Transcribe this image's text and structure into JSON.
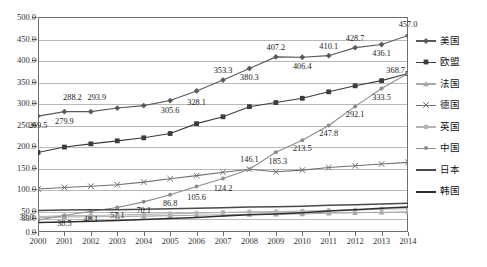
{
  "chart_data": {
    "type": "line",
    "title": "",
    "xlabel": "",
    "ylabel": "",
    "grid": true,
    "legend_position": "right",
    "x": [
      2000,
      2001,
      2002,
      2003,
      2004,
      2005,
      2006,
      2007,
      2008,
      2009,
      2010,
      2011,
      2012,
      2013,
      2014
    ],
    "categories": [
      "2000",
      "2001",
      "2002",
      "2003",
      "2004",
      "2005",
      "2006",
      "2007",
      "2008",
      "2009",
      "2010",
      "2011",
      "2012",
      "2013",
      "2014"
    ],
    "ylim": [
      0,
      500
    ],
    "yticks": [
      "0.0",
      "33.0",
      "50.0",
      "100.0",
      "150.0",
      "200.0",
      "250.0",
      "300.0",
      "350.0",
      "400.0",
      "450.0",
      "500.0"
    ],
    "ytick_values": [
      0,
      33,
      50,
      100,
      150,
      200,
      250,
      300,
      350,
      400,
      450,
      500
    ],
    "series": [
      {
        "name": "美国",
        "marker": "diamond",
        "color": "#5a5a5a",
        "values": [
          269.5,
          279.9,
          279.9,
          288.2,
          293.9,
          305.6,
          328.1,
          353.3,
          380.3,
          407.2,
          406.4,
          410.1,
          428.7,
          436.1,
          457.0
        ],
        "labels": [
          {
            "x": 2000,
            "value": "269.5"
          },
          {
            "x": 2001,
            "value": "279.9"
          },
          {
            "x": 2003,
            "value": "288.2"
          },
          {
            "x": 2005,
            "value": "293.9"
          },
          {
            "x": 2005,
            "value": "305.6"
          },
          {
            "x": 2006,
            "value": "328.1"
          },
          {
            "x": 2007,
            "value": "353.3"
          },
          {
            "x": 2008,
            "value": "380.3"
          },
          {
            "x": 2009,
            "value": "407.2"
          },
          {
            "x": 2010,
            "value": "406.4"
          },
          {
            "x": 2011,
            "value": "410.1"
          },
          {
            "x": 2012,
            "value": "428.7"
          },
          {
            "x": 2013,
            "value": "436.1"
          },
          {
            "x": 2014,
            "value": "457.0"
          }
        ]
      },
      {
        "name": "欧盟",
        "marker": "square",
        "color": "#3c3c3c",
        "values": [
          185.0,
          197.5,
          205.0,
          212.0,
          219.0,
          229.0,
          252.0,
          268.0,
          291.5,
          301.0,
          311.0,
          326.0,
          340.0,
          352.0,
          368.7
        ],
        "labels": []
      },
      {
        "name": "法国",
        "marker": "triangle",
        "color": "#a9a9a9",
        "values": [
          33.0,
          35.0,
          35.5,
          36.0,
          37.0,
          38.0,
          39.0,
          40.0,
          41.0,
          41.5,
          42.0,
          43.5,
          45.0,
          46.0,
          47.0
        ],
        "labels": [
          {
            "x": 2000,
            "value": "33.0"
          }
        ]
      },
      {
        "name": "德国",
        "marker": "cross",
        "color": "#707070",
        "values": [
          100.0,
          103.5,
          106.5,
          110.0,
          116.0,
          124.0,
          131.0,
          139.0,
          146.1,
          140.0,
          144.0,
          150.0,
          154.0,
          158.0,
          162.0
        ],
        "labels": [
          {
            "x": 2008,
            "value": "146.1"
          },
          {
            "x": 2009,
            "value": "185.3"
          }
        ]
      },
      {
        "name": "英国",
        "marker": "circle",
        "color": "#b3b3b3",
        "values": [
          36.0,
          37.5,
          38.5,
          39.5,
          41.0,
          42.5,
          44.0,
          45.5,
          47.0,
          47.5,
          48.5,
          50.0,
          51.5,
          53.0,
          54.0
        ],
        "labels": []
      },
      {
        "name": "中国",
        "marker": "dot",
        "color": "#8c8c8c",
        "values": [
          28.0,
          38.5,
          48.1,
          57.1,
          70.1,
          86.8,
          105.6,
          124.2,
          146.1,
          185.3,
          213.5,
          247.8,
          292.1,
          333.5,
          368.7
        ],
        "labels": [
          {
            "x": 2001,
            "value": "38.5"
          },
          {
            "x": 2002,
            "value": "48.1"
          },
          {
            "x": 2003,
            "value": "57.1"
          },
          {
            "x": 2004,
            "value": "70.1"
          },
          {
            "x": 2005,
            "value": "86.8"
          },
          {
            "x": 2006,
            "value": "105.6"
          },
          {
            "x": 2007,
            "value": "124.2"
          },
          {
            "x": 2010,
            "value": "213.5"
          },
          {
            "x": 2011,
            "value": "247.8"
          },
          {
            "x": 2012,
            "value": "292.1"
          },
          {
            "x": 2013,
            "value": "333.5"
          },
          {
            "x": 2014,
            "value": "368.7"
          }
        ]
      },
      {
        "name": "日本",
        "marker": "none",
        "color": "#4a4a4a",
        "values": [
          50.0,
          51.0,
          51.5,
          52.0,
          53.0,
          54.0,
          55.0,
          56.5,
          58.0,
          58.5,
          60.0,
          62.0,
          63.5,
          65.0,
          67.0
        ],
        "labels": []
      },
      {
        "name": "韩国",
        "marker": "none",
        "color": "#2e2e2e",
        "values": [
          22.0,
          23.5,
          25.0,
          26.5,
          29.0,
          31.5,
          34.0,
          37.0,
          40.0,
          42.0,
          45.0,
          49.0,
          52.0,
          55.0,
          58.0
        ],
        "labels": []
      }
    ],
    "annotations": {
      "end_label_china": "368.7"
    }
  },
  "legend": {
    "items": [
      {
        "label": "美国"
      },
      {
        "label": "欧盟"
      },
      {
        "label": "法国"
      },
      {
        "label": "德国"
      },
      {
        "label": "英国"
      },
      {
        "label": "中国"
      },
      {
        "label": "日本"
      },
      {
        "label": "韩国"
      }
    ]
  }
}
